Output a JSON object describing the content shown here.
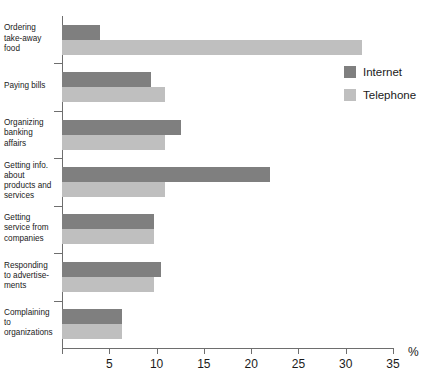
{
  "chart_data": {
    "type": "bar",
    "orientation": "horizontal",
    "title": "",
    "subtitle": "",
    "xlabel": "%",
    "ylabel": "",
    "xlim": [
      0,
      35
    ],
    "xticks": [
      0,
      5,
      10,
      15,
      20,
      25,
      30,
      35
    ],
    "xticklabels": [
      "",
      "5",
      "10",
      "15",
      "20",
      "25",
      "30",
      "35"
    ],
    "grid": false,
    "legend_position": "upper right",
    "categories": [
      "Ordering take-away food",
      "Paying bills",
      "Organizing banking affairs",
      "Getting info. about products and services",
      "Getting service from companies",
      "Responding to advertisements",
      "Complaining to organizations"
    ],
    "category_lines": [
      [
        "Ordering",
        "take-away",
        "food"
      ],
      [
        "Paying bills"
      ],
      [
        "Organizing",
        "banking",
        "affairs"
      ],
      [
        "Getting info.",
        "about",
        "products and",
        "services"
      ],
      [
        "Getting",
        "service from",
        "companies"
      ],
      [
        "Responding",
        "to advertise-",
        "ments"
      ],
      [
        "Complaining",
        "to",
        "organizations"
      ]
    ],
    "series": [
      {
        "name": "Internet",
        "color": "#7f7f7f",
        "values": [
          4.0,
          9.4,
          12.6,
          22.0,
          9.7,
          10.5,
          6.3
        ]
      },
      {
        "name": "Telephone",
        "color": "#bfbfbf",
        "values": [
          31.7,
          10.9,
          10.9,
          10.9,
          9.7,
          9.7,
          6.3
        ]
      }
    ]
  },
  "legend": {
    "items": [
      {
        "label": "Internet",
        "color": "#7f7f7f"
      },
      {
        "label": "Telephone",
        "color": "#bfbfbf"
      }
    ]
  },
  "axis": {
    "unit_label": "%"
  },
  "colors": {
    "internet": "#7f7f7f",
    "telephone": "#bfbfbf",
    "axis": "#6e6e6e",
    "text": "#1a1a1a",
    "background": "#ffffff"
  }
}
